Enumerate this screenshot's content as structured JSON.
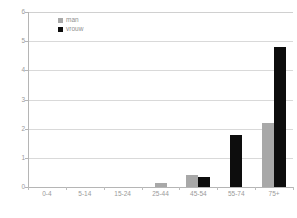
{
  "chart_data": {
    "type": "bar",
    "title": "",
    "subtitle": "",
    "xlabel": "",
    "ylabel": "",
    "categories": [
      "0-4",
      "5-14",
      "15-24",
      "25-44",
      "45-54",
      "55-74",
      "75+"
    ],
    "series": [
      {
        "name": "man",
        "color": "#a8a8a8",
        "values": [
          0,
          0,
          0,
          0.15,
          0.4,
          0,
          2.2
        ]
      },
      {
        "name": "vrouw",
        "color": "#0d0d0d",
        "values": [
          0,
          0,
          0,
          0,
          0.33,
          1.8,
          4.8
        ]
      }
    ],
    "ylim": [
      0,
      6
    ],
    "ytick_step": 1,
    "yticks": [
      "0",
      "1",
      "2",
      "3",
      "4",
      "5",
      "6"
    ],
    "grid": true,
    "grid_axis": "y",
    "legend_position": "top-left-inside",
    "background": "#ffffff",
    "gridline_color": "#d9d9d9",
    "axis_color": "#b5b5b5",
    "tick_label_color": "#9a9a9a"
  },
  "legend": {
    "items": [
      {
        "label": "man"
      },
      {
        "label": "vrouw"
      }
    ]
  }
}
